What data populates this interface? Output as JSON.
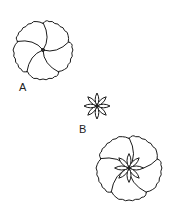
{
  "figure": {
    "line_color": "#1a1a1a",
    "background": "#ffffff",
    "items": [
      {
        "label": "A",
        "name": "ruffled-flower",
        "cx": 43,
        "cy": 50,
        "r": 29,
        "petals": 5
      },
      {
        "label": "B",
        "name": "star-flower",
        "cx": 97,
        "cy": 106,
        "r": 13,
        "petals": 8
      },
      {
        "label": "",
        "name": "combined-flower",
        "cx": 129,
        "cy": 168,
        "r": 32,
        "petals": 5,
        "inner_petals": 8
      }
    ]
  }
}
